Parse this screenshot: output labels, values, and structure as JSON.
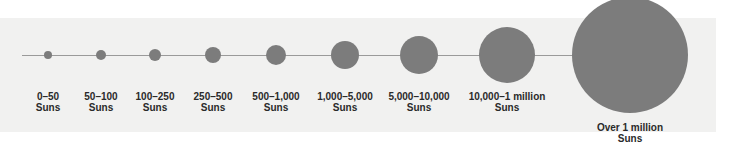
{
  "diagram": {
    "type": "size-scale",
    "fill_color": "#7c7c7c",
    "line_color": "#9a9a9a",
    "items": [
      {
        "range": "0–50",
        "unit": "Suns",
        "cx": 48,
        "r": 4
      },
      {
        "range": "50–100",
        "unit": "Suns",
        "cx": 101,
        "r": 5
      },
      {
        "range": "100–250",
        "unit": "Suns",
        "cx": 155,
        "r": 6
      },
      {
        "range": "250–500",
        "unit": "Suns",
        "cx": 213,
        "r": 8
      },
      {
        "range": "500–1,000",
        "unit": "Suns",
        "cx": 276,
        "r": 10
      },
      {
        "range": "1,000–5,000",
        "unit": "Suns",
        "cx": 345,
        "r": 14
      },
      {
        "range": "5,000–10,000",
        "unit": "Suns",
        "cx": 419,
        "r": 19
      },
      {
        "range": "10,000–1 million",
        "unit": "Suns",
        "cx": 507,
        "r": 28
      },
      {
        "range": "Over 1 million",
        "unit": "Suns",
        "cx": 630,
        "r": 58
      }
    ]
  }
}
